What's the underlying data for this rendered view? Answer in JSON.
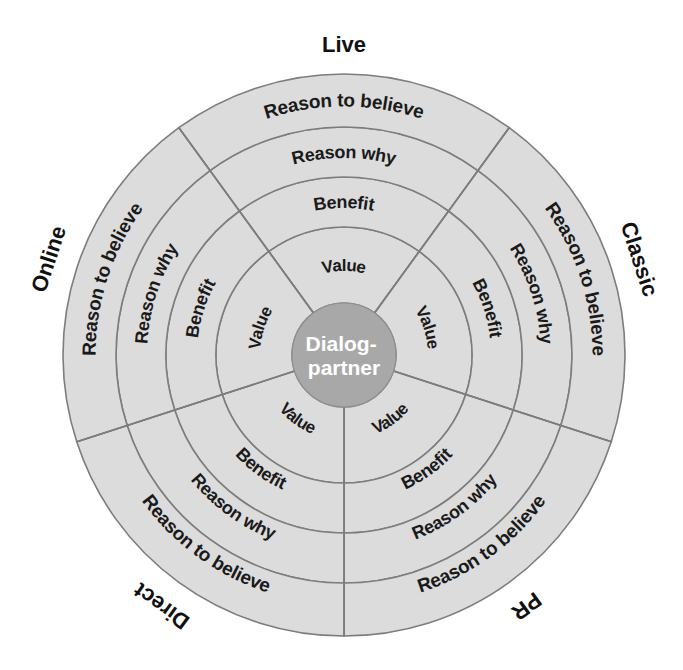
{
  "diagram": {
    "hub": {
      "line1": "Dialog-",
      "line2": "partner",
      "fill": "#a8a8a8",
      "text_color": "#ffffff"
    },
    "colors": {
      "ring_fill": "#dcdcdc",
      "ring_stroke": "#7d7d7d",
      "hub_fill": "#a8a8a8",
      "label_color": "#1a1a1a",
      "background": "#ffffff"
    },
    "ring_labels_inner_to_outer": [
      "Value",
      "Benefit",
      "Reason why",
      "Reason to believe"
    ],
    "sectors": [
      {
        "name": "Live",
        "label": "Live",
        "position": "top",
        "center_angle_deg": -90,
        "start_angle_deg": -126,
        "end_angle_deg": -54,
        "rings": [
          "Value",
          "Benefit",
          "Reason why",
          "Reason to believe"
        ]
      },
      {
        "name": "Classic",
        "label": "Classic",
        "position": "upper-right",
        "center_angle_deg": -18,
        "start_angle_deg": -54,
        "end_angle_deg": 18,
        "rings": [
          "Value",
          "Benefit",
          "Reason why",
          "Reason to believe"
        ]
      },
      {
        "name": "PR",
        "label": "PR",
        "position": "lower-right",
        "center_angle_deg": 54,
        "start_angle_deg": 18,
        "end_angle_deg": 90,
        "rings": [
          "Value",
          "Benefit",
          "Reason why",
          "Reason to believe"
        ]
      },
      {
        "name": "Direct",
        "label": "Direct",
        "position": "lower-left",
        "center_angle_deg": 126,
        "start_angle_deg": 90,
        "end_angle_deg": 162,
        "rings": [
          "Value",
          "Benefit",
          "Reason why",
          "Reason to believe"
        ]
      },
      {
        "name": "Online",
        "label": "Online",
        "position": "upper-left",
        "center_angle_deg": 198,
        "start_angle_deg": 162,
        "end_angle_deg": 234,
        "rings": [
          "Value",
          "Benefit",
          "Reason why",
          "Reason to believe"
        ]
      }
    ],
    "geometry": {
      "center_x": 344,
      "center_y": 355,
      "hub_radius": 52,
      "ring_radii": [
        128,
        178,
        228,
        281
      ]
    }
  }
}
